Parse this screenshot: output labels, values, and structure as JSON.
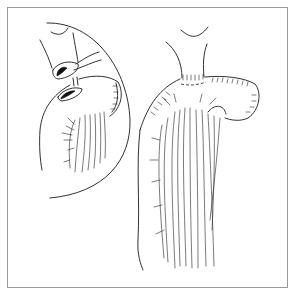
{
  "figure": {
    "type": "surgical line illustration",
    "panels": [
      {
        "name": "inset-detail",
        "description": "circular magnified inset showing two openings being anastomosed"
      },
      {
        "name": "main-view",
        "description": "stomach segment sutured to esophageal stump with mesenteric vessels"
      }
    ],
    "text_labels": []
  },
  "colors": {
    "line": "#1a1a1a",
    "frame": "#9a9a9a",
    "background": "#ffffff"
  }
}
